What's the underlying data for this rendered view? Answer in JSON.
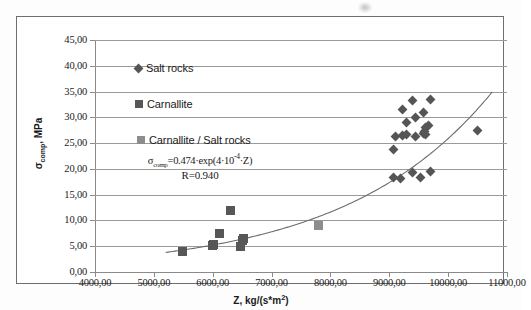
{
  "chart_data": {
    "type": "scatter",
    "title": "",
    "xlabel": "Z, kg/(s*m2)",
    "ylabel": "σcomp, MPa",
    "xlim": [
      4000,
      11000
    ],
    "ylim": [
      0,
      45
    ],
    "grid": true,
    "legend_position": "inside-upper-left",
    "x_ticks": [
      "4000,00",
      "5000,00",
      "6000,00",
      "7000,00",
      "8000,00",
      "9000,00",
      "10000,00",
      "11000,00"
    ],
    "x_tick_values": [
      4000,
      5000,
      6000,
      7000,
      8000,
      9000,
      10000,
      11000
    ],
    "y_ticks": [
      "0,00",
      "5,00",
      "10,00",
      "15,00",
      "20,00",
      "25,00",
      "30,00",
      "35,00",
      "40,00",
      "45,00"
    ],
    "y_tick_values": [
      0,
      5,
      10,
      15,
      20,
      25,
      30,
      35,
      40,
      45
    ],
    "annotations": [
      {
        "name": "regression-equation",
        "text": "σcomp=0.474·exp(4·10-4·Z)"
      },
      {
        "name": "correlation-coefficient",
        "text": "R=0.940"
      }
    ],
    "series": [
      {
        "name": "Salt rocks",
        "marker": "diamond",
        "color": "#555555",
        "points": [
          [
            9080,
            18.3
          ],
          [
            9190,
            18.2
          ],
          [
            9390,
            19.3
          ],
          [
            9530,
            18.3
          ],
          [
            9700,
            19.4
          ],
          [
            9080,
            23.8
          ],
          [
            9100,
            26.3
          ],
          [
            9220,
            26.5
          ],
          [
            9290,
            26.6
          ],
          [
            9440,
            26.3
          ],
          [
            9580,
            26.9
          ],
          [
            9600,
            27.3
          ],
          [
            9610,
            28.0
          ],
          [
            9620,
            26.6
          ],
          [
            9300,
            29.0
          ],
          [
            9230,
            31.5
          ],
          [
            9580,
            31.0
          ],
          [
            9450,
            30.0
          ],
          [
            9390,
            33.2
          ],
          [
            9700,
            33.5
          ],
          [
            9660,
            28.5
          ],
          [
            10500,
            27.4
          ]
        ]
      },
      {
        "name": "Carnallite",
        "marker": "square",
        "color": "#575757",
        "points": [
          [
            5480,
            4.0
          ],
          [
            5990,
            5.2
          ],
          [
            6010,
            5.4
          ],
          [
            6120,
            7.5
          ],
          [
            6300,
            11.9
          ],
          [
            6480,
            5.0
          ],
          [
            6500,
            6.2
          ],
          [
            6520,
            6.5
          ]
        ]
      },
      {
        "name": "Carnallite / Salt rocks",
        "marker": "square",
        "color": "#8d8d8d",
        "points": [
          [
            7800,
            9.0
          ]
        ]
      }
    ],
    "trendline": {
      "name": "exponential-fit",
      "equation": "y = 0.474*exp(4e-4*x)",
      "a": 0.474,
      "b": 0.0004,
      "r": 0.94,
      "color": "#6b6b6b"
    }
  },
  "axes": {
    "x_title_main": "Z, kg/(s*m",
    "x_title_sup": "2",
    "x_title_tail": ")",
    "y_title_main": "σ",
    "y_title_sub": "comp",
    "y_title_tail": ", MPa"
  },
  "legend": {
    "items": [
      {
        "label": "Salt rocks",
        "marker": "diamond",
        "color": "#555555"
      },
      {
        "label": "Carnallite",
        "marker": "square",
        "color": "#575757"
      },
      {
        "label": "Carnallite / Salt rocks",
        "marker": "square",
        "color": "#8d8d8d"
      }
    ]
  },
  "equation": {
    "sigma": "σ",
    "sub": "comp",
    "body": "=0.474·exp(4·10",
    "sup": "-4",
    "tail": "·Z)",
    "r_text": "R=0.940"
  }
}
